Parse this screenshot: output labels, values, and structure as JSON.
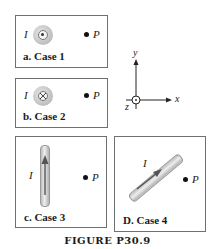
{
  "figure": {
    "caption": "FIGURE P30.9",
    "current_symbol": "I",
    "point_symbol": "P"
  },
  "cases": [
    {
      "label": "a. Case 1",
      "wire": "out-of-page (dot)"
    },
    {
      "label": "b. Case 2",
      "wire": "into-page (cross)"
    },
    {
      "label": "c. Case 3",
      "wire": "vertical, current upward"
    },
    {
      "label": "D. Case 4",
      "wire": "diagonal, current up-right"
    }
  ],
  "axes": {
    "x_label": "x",
    "y_label": "y",
    "z_label": "z"
  }
}
